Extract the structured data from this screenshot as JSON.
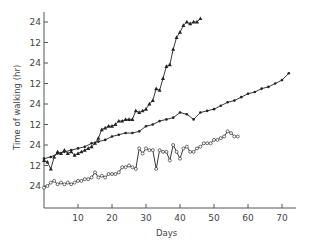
{
  "chart_data": {
    "type": "line",
    "title": "",
    "xlabel": "Days",
    "ylabel": "Time of walking (hr)",
    "xlim": [
      0,
      74
    ],
    "x_ticks": [
      10,
      20,
      30,
      40,
      50,
      60,
      70
    ],
    "y_tick_labels_bottom_to_top": [
      "24",
      "12",
      "24",
      "12",
      "24",
      "12",
      "24",
      "12",
      "24"
    ],
    "y_tick_spacing_hr": 12,
    "grid": false,
    "legend": null,
    "note": "Y values are cumulative hours above the lowest '24' tick (each tick = 12 hr).",
    "series": [
      {
        "name": "triangles",
        "marker": "filled-triangle",
        "x": [
          0,
          1,
          2,
          3,
          4,
          5,
          6,
          7,
          8,
          9,
          10,
          11,
          12,
          13,
          14,
          15,
          16,
          17,
          18,
          19,
          20,
          21,
          22,
          23,
          24,
          25,
          26,
          27,
          28,
          29,
          30,
          31,
          32,
          33,
          34,
          35,
          36,
          37,
          38,
          39,
          40,
          41,
          42,
          43,
          44,
          45,
          46
        ],
        "y": [
          15,
          14,
          10,
          17,
          20,
          19,
          21,
          19,
          20,
          18,
          19,
          20,
          21,
          22,
          23,
          25,
          28,
          33,
          34,
          35,
          35,
          36,
          38,
          38,
          39,
          39,
          39,
          44,
          43,
          44,
          45,
          48,
          50,
          57,
          56,
          63,
          70,
          71,
          80,
          87,
          90,
          94,
          96,
          95,
          96,
          96,
          98
        ]
      },
      {
        "name": "filled-dots",
        "marker": "filled-dot",
        "x": [
          0,
          2,
          4,
          6,
          8,
          10,
          12,
          14,
          16,
          18,
          20,
          22,
          24,
          26,
          28,
          30,
          32,
          34,
          36,
          38,
          40,
          42,
          44,
          46,
          48,
          50,
          52,
          54,
          56,
          58,
          60,
          62,
          64,
          66,
          68,
          70,
          72
        ],
        "y": [
          16,
          17,
          19,
          20,
          21,
          22,
          23,
          25,
          26,
          27,
          29,
          30,
          31,
          31,
          32,
          35,
          36,
          38,
          39,
          40,
          43,
          42,
          39,
          43,
          44,
          45,
          47,
          49,
          50,
          52,
          54,
          55,
          57,
          58,
          60,
          62,
          66
        ]
      },
      {
        "name": "open-circles",
        "marker": "open-circle",
        "x": [
          0,
          1,
          2,
          3,
          4,
          5,
          6,
          7,
          8,
          9,
          10,
          11,
          12,
          13,
          14,
          15,
          16,
          17,
          18,
          19,
          20,
          21,
          22,
          23,
          24,
          25,
          26,
          27,
          28,
          29,
          30,
          31,
          32,
          33,
          34,
          35,
          36,
          37,
          38,
          39,
          40,
          41,
          42,
          43,
          44,
          45,
          46,
          47,
          48,
          49,
          50,
          51,
          52,
          53,
          54,
          55,
          56,
          57
        ],
        "y": [
          -1,
          0,
          2,
          3,
          1,
          2,
          1,
          2,
          1,
          2,
          3,
          3,
          4,
          4,
          5,
          8,
          5,
          6,
          5,
          7,
          7,
          7,
          8,
          11,
          11,
          12,
          11,
          10,
          22,
          19,
          22,
          21,
          21,
          10,
          21,
          20,
          20,
          15,
          24,
          20,
          16,
          22,
          23,
          20,
          20,
          22,
          23,
          25,
          25,
          25,
          27,
          27,
          28,
          29,
          32,
          31,
          29,
          29
        ]
      }
    ]
  }
}
